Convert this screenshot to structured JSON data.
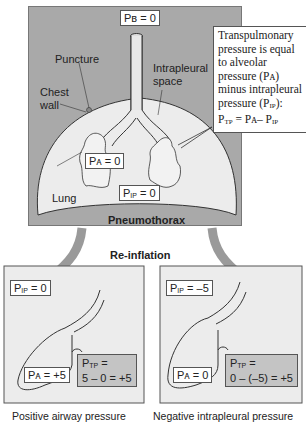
{
  "top_panel": {
    "bronchus_pressure": "Pʙ = 0",
    "puncture_label": "Puncture",
    "chest_wall_label": "Chest wall",
    "intrapleural_space_label": "Intrapleural space",
    "alveolar_pressure": "Pᴀ = 0",
    "lung_label": "Lung",
    "intrapleural_pressure": "= 0",
    "intrapleural_pressure_sym": "P",
    "intrapleural_pressure_sub": "IP",
    "pneumothorax_label": "Pneumothorax",
    "note": {
      "line1": "Transpulmonary",
      "line2": "pressure is equal",
      "line3": "to alveolar",
      "line4": "pressure (Pᴀ)",
      "line5": "minus intrapleural",
      "line6a": "pressure (P",
      "line6sub": "IP",
      "line6b": "):",
      "formula_p": "P",
      "formula_tp": "TP",
      "formula_mid": " = Pᴀ– P",
      "formula_ip": "IP"
    }
  },
  "reinflation_label": "Re-inflation",
  "panels": [
    {
      "ip_sym": "P",
      "ip_sub": "IP",
      "ip_value": "= 0",
      "alveolar": "Pᴀ = +5",
      "ptp_sym": "P",
      "ptp_sub": "TP",
      "ptp_eq": " =",
      "ptp_calc": "5 – 0 = +5",
      "caption": "Positive airway pressure"
    },
    {
      "ip_sym": "P",
      "ip_sub": "IP",
      "ip_value": "= –5",
      "alveolar": "Pᴀ = 0",
      "ptp_sym": "P",
      "ptp_sub": "TP",
      "ptp_eq": " =",
      "ptp_calc": "0 – (–5) = +5",
      "caption": "Negative intrapleural pressure"
    }
  ],
  "colors": {
    "panel_gray": "#a9a9a9",
    "lung_fill": "#ececec",
    "ptp_fill": "#c4c4c4",
    "arrow_gray": "#9a9a9a"
  }
}
